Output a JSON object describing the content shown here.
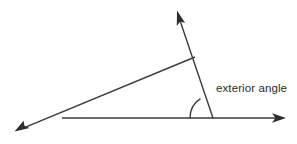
{
  "diagram": {
    "labels": {
      "exterior_angle": "exterior angle"
    },
    "colors": {
      "background": "#ffffff",
      "line": "#3b3b3b",
      "arrowhead": "#2e2e2e",
      "text": "#2b2b2b"
    },
    "geometry": {
      "vertex": {
        "x": 213,
        "y": 118
      },
      "apex": {
        "x": 195,
        "y": 57
      },
      "base_left_intersection": {
        "x": 62,
        "y": 118
      },
      "rays": [
        {
          "name": "horizontal-ray",
          "from": {
            "x": 62,
            "y": 118
          },
          "to": {
            "x": 285,
            "y": 118
          },
          "arrow_at": "end"
        },
        {
          "name": "transversal-ray",
          "from": {
            "x": 213,
            "y": 118
          },
          "to": {
            "x": 177,
            "y": 12
          },
          "arrow_at": "end"
        },
        {
          "name": "slanted-ray",
          "from": {
            "x": 195,
            "y": 57
          },
          "to": {
            "x": 16,
            "y": 131
          },
          "arrow_at": "end"
        }
      ],
      "arc": {
        "name": "exterior-angle-arc",
        "center": {
          "x": 213,
          "y": 118
        },
        "radius": 23,
        "start_angle_deg": 180,
        "end_angle_deg": 71
      }
    },
    "label_position": {
      "x": 216,
      "y": 92
    }
  }
}
